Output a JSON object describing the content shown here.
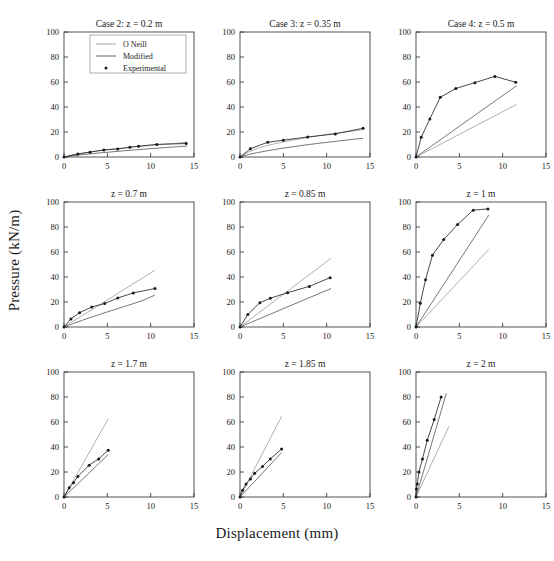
{
  "figure": {
    "xlabel": "Displacement (mm)",
    "ylabel": "Pressure (kN/m)",
    "rows": 3,
    "cols": 3
  },
  "axes": {
    "xlim": [
      0,
      15
    ],
    "ylim": [
      0,
      100
    ],
    "xticks": [
      0,
      5,
      10,
      15
    ],
    "yticks": [
      0,
      20,
      40,
      60,
      80,
      100
    ],
    "xtick_labels": [
      "0",
      "5",
      "10",
      "15"
    ],
    "ytick_labels": [
      "0",
      "20",
      "40",
      "60",
      "80",
      "100"
    ],
    "grid": false
  },
  "colors": {
    "oneill": "#9a9a9a",
    "modified": "#555555",
    "experimental": "#1a1a1a",
    "frame": "#2b2b2b",
    "background": "#ffffff"
  },
  "legend": {
    "position": "top-center-panel-1",
    "entries": [
      {
        "label": "O Neill",
        "style": "line",
        "color": "#9a9a9a"
      },
      {
        "label": "Modified",
        "style": "line",
        "color": "#555555"
      },
      {
        "label": "Experimental",
        "style": "marker",
        "color": "#1a1a1a"
      }
    ]
  },
  "chart_data": {
    "type": "line",
    "title": "",
    "xlabel": "Displacement (mm)",
    "ylabel": "Pressure (kN/m)",
    "xlim": [
      0,
      15
    ],
    "ylim": [
      0,
      100
    ],
    "panels": [
      {
        "title": "Case 2: z = 0.2 m",
        "row": 0,
        "col": 0,
        "series": [
          {
            "name": "O Neill",
            "x": [
              0,
              1,
              2,
              3,
              4,
              5,
              6,
              7,
              8,
              9,
              10,
              11,
              12,
              13,
              14.2
            ],
            "y": [
              0,
              1.7,
              3.0,
              4.1,
              5.0,
              5.9,
              6.7,
              7.4,
              8.1,
              8.7,
              9.3,
              9.9,
              10.5,
              11.0,
              11.9
            ]
          },
          {
            "name": "Modified",
            "x": [
              0,
              1,
              2,
              3,
              4,
              5,
              6,
              7,
              8,
              9,
              10,
              11,
              12,
              13,
              14.2
            ],
            "y": [
              0,
              1.0,
              1.8,
              2.5,
              3.2,
              3.8,
              4.4,
              5.0,
              5.6,
              6.1,
              6.7,
              7.2,
              7.7,
              8.2,
              8.8
            ]
          },
          {
            "name": "Experimental",
            "x": [
              0,
              1.6,
              3.0,
              4.6,
              6.2,
              7.6,
              8.6,
              10.7,
              14.1
            ],
            "y": [
              0,
              2.4,
              3.9,
              5.7,
              6.4,
              7.8,
              8.6,
              10.1,
              10.8
            ]
          }
        ]
      },
      {
        "title": "Case 3: z = 0.35 m",
        "row": 0,
        "col": 1,
        "series": [
          {
            "name": "O Neill",
            "x": [
              0,
              1,
              2,
              3,
              4,
              5,
              6,
              7,
              8,
              9,
              10,
              11,
              12,
              13,
              14.2
            ],
            "y": [
              0,
              4.1,
              6.8,
              8.9,
              10.6,
              12.1,
              13.5,
              14.7,
              15.9,
              17.0,
              18.0,
              19.0,
              19.9,
              20.8,
              21.8
            ]
          },
          {
            "name": "Modified",
            "x": [
              0,
              1,
              2,
              3,
              4,
              5,
              6,
              7,
              8,
              9,
              10,
              11,
              12,
              13,
              14.2
            ],
            "y": [
              0,
              2.0,
              3.5,
              4.8,
              6.0,
              7.1,
              8.1,
              9.1,
              10.0,
              10.9,
              11.7,
              12.5,
              13.3,
              14.1,
              15.0
            ]
          },
          {
            "name": "Experimental",
            "x": [
              0,
              1.2,
              3.2,
              5.0,
              7.8,
              11.0,
              14.2
            ],
            "y": [
              0,
              6.6,
              11.8,
              13.5,
              16.0,
              18.5,
              23.0
            ]
          }
        ]
      },
      {
        "title": "Case 4: z = 0.5 m",
        "row": 0,
        "col": 2,
        "series": [
          {
            "name": "O Neill",
            "x": [
              0,
              11.6
            ],
            "y": [
              0,
              42.0
            ]
          },
          {
            "name": "Modified",
            "x": [
              0,
              11.6
            ],
            "y": [
              0,
              57.0
            ]
          },
          {
            "name": "Experimental",
            "x": [
              0,
              0.6,
              1.6,
              2.8,
              4.6,
              6.8,
              9.1,
              11.5
            ],
            "y": [
              0,
              15.8,
              30.5,
              47.8,
              54.8,
              59.5,
              64.5,
              59.8
            ]
          }
        ]
      },
      {
        "title": "z = 0.7 m",
        "row": 1,
        "col": 0,
        "series": [
          {
            "name": "O Neill",
            "x": [
              0,
              10.5
            ],
            "y": [
              0,
              45.5
            ]
          },
          {
            "name": "Modified",
            "x": [
              0,
              1,
              2,
              3,
              4,
              5,
              6,
              7,
              8,
              9,
              10.5
            ],
            "y": [
              0,
              2.6,
              5.1,
              7.5,
              9.8,
              12.1,
              14.3,
              16.5,
              18.7,
              21.0,
              25.5
            ]
          },
          {
            "name": "Experimental",
            "x": [
              0,
              0.8,
              1.8,
              3.2,
              4.7,
              6.2,
              8.0,
              10.5
            ],
            "y": [
              0,
              6.5,
              11.5,
              16.0,
              18.8,
              23.2,
              27.3,
              30.8
            ]
          }
        ]
      },
      {
        "title": "z = 0.85 m",
        "row": 1,
        "col": 1,
        "series": [
          {
            "name": "O Neill",
            "x": [
              0,
              10.5
            ],
            "y": [
              0,
              55.0
            ]
          },
          {
            "name": "Modified",
            "x": [
              0,
              10.5
            ],
            "y": [
              0,
              30.8
            ]
          },
          {
            "name": "Experimental",
            "x": [
              0,
              0.9,
              2.3,
              3.5,
              5.5,
              8.0,
              10.4
            ],
            "y": [
              0,
              10.0,
              19.5,
              23.0,
              27.5,
              32.5,
              39.5
            ]
          }
        ]
      },
      {
        "title": "z = 1 m",
        "row": 1,
        "col": 2,
        "series": [
          {
            "name": "O Neill",
            "x": [
              0,
              8.4
            ],
            "y": [
              0,
              62.0
            ]
          },
          {
            "name": "Modified",
            "x": [
              0,
              8.4
            ],
            "y": [
              0,
              89.5
            ]
          },
          {
            "name": "Experimental",
            "x": [
              0,
              0.5,
              1.1,
              1.9,
              3.2,
              4.8,
              6.6,
              8.3
            ],
            "y": [
              0,
              19.0,
              37.8,
              57.5,
              70.0,
              82.0,
              93.5,
              94.5
            ]
          }
        ]
      },
      {
        "title": "z = 1.7 m",
        "row": 2,
        "col": 0,
        "series": [
          {
            "name": "O Neill",
            "x": [
              0,
              5.1
            ],
            "y": [
              0,
              62.5
            ]
          },
          {
            "name": "Modified",
            "x": [
              0,
              5.1
            ],
            "y": [
              0,
              34.0
            ]
          },
          {
            "name": "Experimental",
            "x": [
              0,
              0.6,
              1.1,
              1.6,
              2.9,
              4.0,
              5.1
            ],
            "y": [
              0,
              7.5,
              11.5,
              16.5,
              25.5,
              30.5,
              37.5
            ]
          }
        ]
      },
      {
        "title": "z = 1.85 m",
        "row": 2,
        "col": 1,
        "series": [
          {
            "name": "O Neill",
            "x": [
              0,
              4.8
            ],
            "y": [
              0,
              64.5
            ]
          },
          {
            "name": "Modified",
            "x": [
              0,
              4.8
            ],
            "y": [
              0,
              35.5
            ]
          },
          {
            "name": "Experimental",
            "x": [
              0,
              0.3,
              0.7,
              1.2,
              1.7,
              2.6,
              3.5,
              4.8
            ],
            "y": [
              0,
              5.5,
              10.5,
              14.5,
              19.0,
              24.5,
              30.5,
              38.5
            ]
          }
        ]
      },
      {
        "title": "z = 2 m",
        "row": 2,
        "col": 2,
        "series": [
          {
            "name": "O Neill",
            "x": [
              0,
              3.8
            ],
            "y": [
              0,
              56.5
            ]
          },
          {
            "name": "Modified",
            "x": [
              0,
              3.5
            ],
            "y": [
              0,
              83.0
            ]
          },
          {
            "name": "Experimental",
            "x": [
              0,
              0.05,
              0.15,
              0.35,
              0.75,
              1.3,
              2.1,
              2.9
            ],
            "y": [
              0,
              6.5,
              10.5,
              20.0,
              30.5,
              45.5,
              62.0,
              80.0
            ]
          }
        ]
      }
    ]
  }
}
